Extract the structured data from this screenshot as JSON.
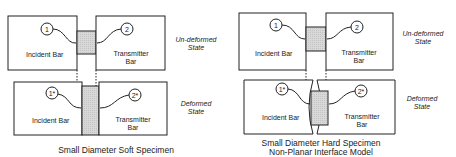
{
  "left": {
    "top": {
      "incident": "Incident Bar",
      "transmitter_1": "Transmitter",
      "transmitter_2": "Bar",
      "g1": "1",
      "g2": "2"
    },
    "bottom": {
      "incident": "Incident Bar",
      "transmitter_1": "Transmitter",
      "transmitter_2": "Bar",
      "g1": "1*",
      "g2": "2*"
    },
    "state_top_1": "Un-deformed",
    "state_top_2": "State",
    "state_bottom_1": "Deformed",
    "state_bottom_2": "State",
    "caption": "Small Diameter Soft Specimen"
  },
  "right": {
    "top": {
      "incident": "Incident Bar",
      "transmitter_1": "Transmitter",
      "transmitter_2": "Bar",
      "g1": "1",
      "g2": "2"
    },
    "bottom": {
      "incident": "Incident Bar",
      "transmitter_1": "Transmitter",
      "transmitter_2": "Bar",
      "g1": "1*",
      "g2": "2*"
    },
    "state_top_1": "Un-deformed",
    "state_top_2": "State",
    "state_bottom_1": "Deformed",
    "state_bottom_2": "State",
    "caption_1": "Small Diameter Hard Specimen",
    "caption_2": "Non-Planar Interface Model"
  }
}
